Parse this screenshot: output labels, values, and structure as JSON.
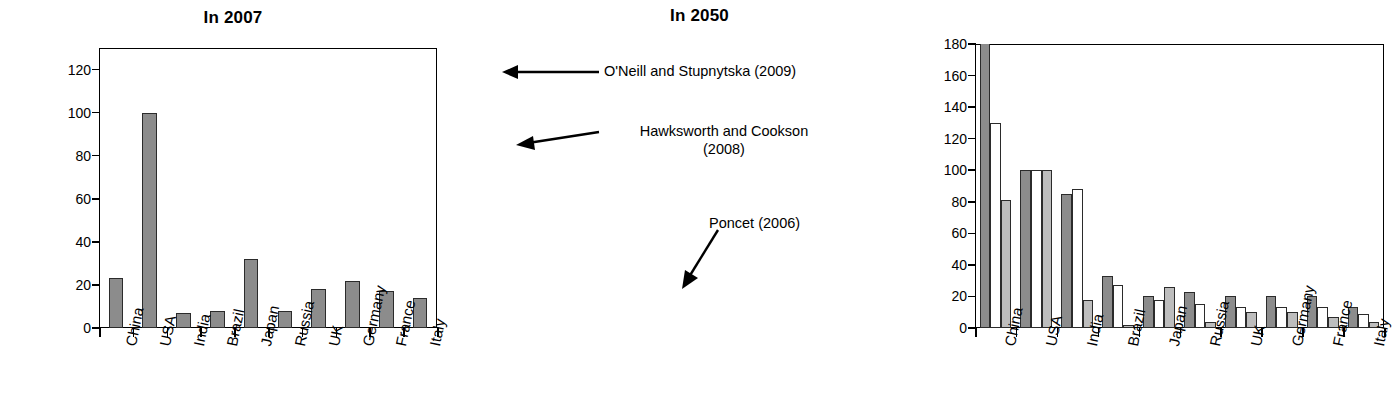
{
  "chart_data": [
    {
      "type": "bar",
      "title": "In 2007",
      "xlabel": "",
      "ylabel": "",
      "ylim": [
        0,
        130
      ],
      "yticks": [
        0,
        20,
        40,
        60,
        80,
        100,
        120
      ],
      "grid": false,
      "legend": "none",
      "categories": [
        "China",
        "USA",
        "India",
        "Brazil",
        "Japan",
        "Russia",
        "UK",
        "Germany",
        "France",
        "Italy"
      ],
      "series": [
        {
          "name": "2007",
          "values": [
            23,
            100,
            7,
            8,
            32,
            8,
            18,
            22,
            17,
            14
          ],
          "color": "#8c8c8c"
        }
      ]
    },
    {
      "type": "bar",
      "title": "In 2050",
      "xlabel": "",
      "ylabel": "",
      "ylim": [
        0,
        180
      ],
      "yticks": [
        0,
        20,
        40,
        60,
        80,
        100,
        120,
        140,
        160,
        180
      ],
      "grid": false,
      "legend": "annotations",
      "categories": [
        "China",
        "USA",
        "India",
        "Brazil",
        "Japan",
        "Russia",
        "UK",
        "Germany",
        "France",
        "Italy"
      ],
      "series": [
        {
          "name": "O'Neill and Stupnytska (2009)",
          "values": [
            185,
            100,
            85,
            33,
            20,
            23,
            20,
            20,
            20,
            13
          ],
          "color": "#8c8c8c",
          "clipped": [
            true,
            false,
            false,
            false,
            false,
            false,
            false,
            false,
            false,
            false
          ]
        },
        {
          "name": "Hawksworth and Cookson (2008)",
          "values": [
            130,
            100,
            88,
            27,
            18,
            15,
            13,
            13,
            13,
            9
          ],
          "color": "#ffffff"
        },
        {
          "name": "Poncet (2006)",
          "values": [
            81,
            100,
            18,
            2,
            26,
            4,
            10,
            10,
            7,
            4
          ],
          "color": "#bdbdbd"
        }
      ],
      "annotations": [
        {
          "id": "oneill",
          "text": "O'Neill and Stupnytska (2009)",
          "target_series": 0,
          "target_category": "China"
        },
        {
          "id": "hawksworth",
          "text_line1": "Hawksworth and Cookson",
          "text_line2": "(2008)",
          "target_series": 1,
          "target_category": "China"
        },
        {
          "id": "poncet",
          "text": "Poncet (2006)",
          "target_series": 2,
          "target_category": "Japan"
        }
      ]
    }
  ],
  "panel_2007": {
    "title": "In 2007",
    "yticks": [
      "120",
      "100",
      "80",
      "60",
      "40",
      "20",
      "0"
    ],
    "categories": [
      "China",
      "USA",
      "India",
      "Brazil",
      "Japan",
      "Russia",
      "Germany",
      "France",
      "Italy",
      "UK"
    ],
    "labels": {
      "c0": "China",
      "c1": "USA",
      "c2": "India",
      "c3": "Brazil",
      "c4": "Japan",
      "c5": "Russia",
      "c6": "UK",
      "c7": "Germany",
      "c8": "France",
      "c9": "Italy"
    }
  },
  "panel_2050": {
    "title": "In 2050",
    "yticks": [
      "180",
      "160",
      "140",
      "120",
      "100",
      "80",
      "60",
      "40",
      "20",
      "0"
    ],
    "labels": {
      "c0": "China",
      "c1": "USA",
      "c2": "India",
      "c3": "Brazil",
      "c4": "Japan",
      "c5": "Russia",
      "c6": "UK",
      "c7": "Germany",
      "c8": "France",
      "c9": "Italy"
    },
    "annotations": {
      "oneill": "O'Neill and Stupnytska (2009)",
      "hawksworth_l1": "Hawksworth and Cookson",
      "hawksworth_l2": "(2008)",
      "poncet": "Poncet (2006)"
    }
  },
  "colors": {
    "series_oneill": "#8c8c8c",
    "series_hawksworth": "#ffffff",
    "series_poncet": "#bdbdbd",
    "axis": "#000000",
    "background": "#ffffff"
  }
}
